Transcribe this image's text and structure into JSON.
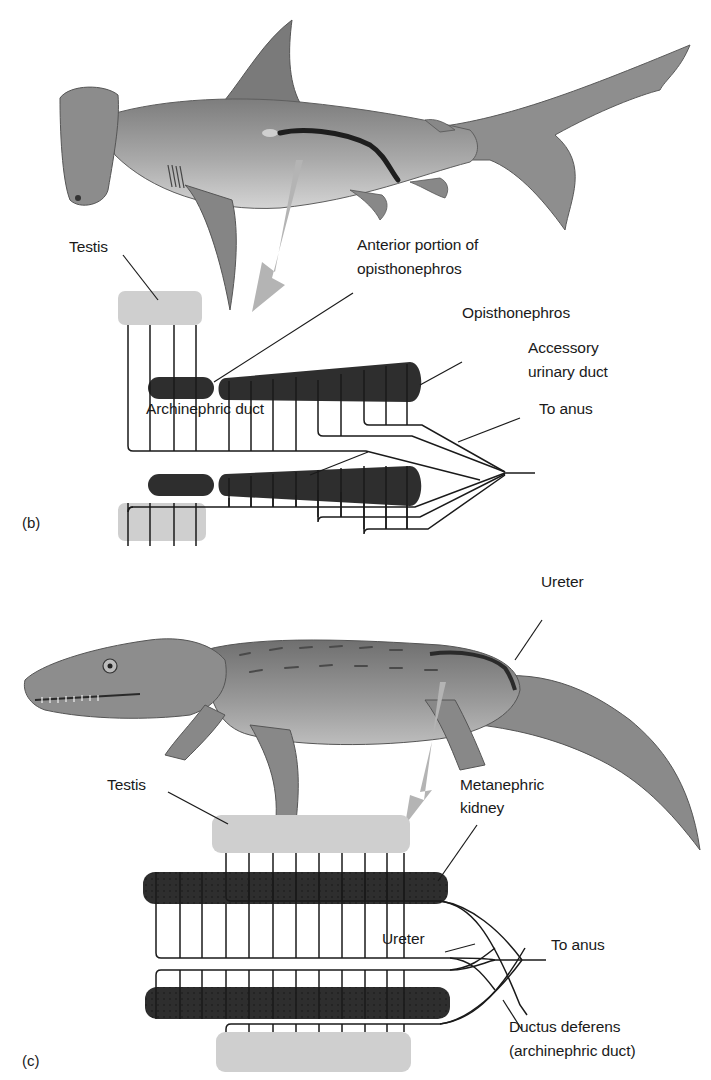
{
  "panel_b": {
    "letter": "(b)",
    "animal": "hammerhead-shark",
    "labels": {
      "testis": "Testis",
      "anterior_line1": "Anterior portion of",
      "anterior_line2": "opisthonephros",
      "opisthonephros": "Opisthonephros",
      "accessory_line1": "Accessory",
      "accessory_line2": "urinary duct",
      "archinephric": "Archinephric duct",
      "to_anus": "To anus"
    }
  },
  "panel_c": {
    "letter": "(c)",
    "animal": "alligator",
    "labels": {
      "ureter_top": "Ureter",
      "testis": "Testis",
      "metanephric_line1": "Metanephric",
      "metanephric_line2": "kidney",
      "ureter": "Ureter",
      "to_anus": "To anus",
      "ductus_line1": "Ductus deferens",
      "ductus_line2": "(archinephric duct)"
    }
  },
  "colors": {
    "kidney": "#2e2e2e",
    "testis": "#cfcfcf",
    "arrow": "#b4b4b4",
    "animal_body": "#9a9a9a",
    "line": "#1a1a1a"
  }
}
